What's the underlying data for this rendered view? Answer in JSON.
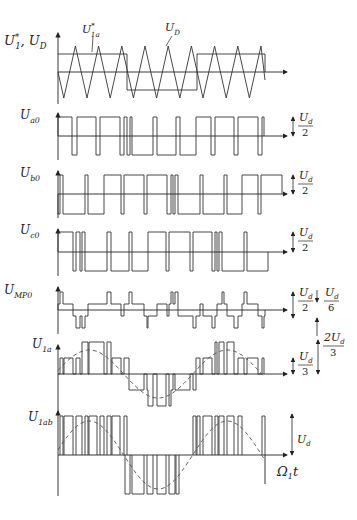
{
  "figure": {
    "axis_x_start": 58,
    "axis_x_end": 287,
    "wave_x_end": 265
  },
  "panels": [
    {
      "id": "ref",
      "label_main": "U",
      "label_sup": "*",
      "label_sub": "1",
      "label_suffix": ", U",
      "label_suffix_sub": "D",
      "zero_y": 72,
      "top_y": 33,
      "bottom_y": 104,
      "callouts": [
        {
          "text": "U",
          "sup": "*",
          "sub": "1a",
          "x": 82,
          "y": 33,
          "lx1": 93,
          "ly1": 36,
          "lx2": 92,
          "ly2": 52
        },
        {
          "text": "U",
          "sub": "D",
          "x": 165,
          "y": 31,
          "lx1": 172,
          "ly1": 36,
          "lx2": 166,
          "ly2": 46
        }
      ],
      "triangle": {
        "peak_y": 46,
        "valley_y": 98,
        "start_x": 58,
        "start_y": 72,
        "half_period": 11.6
      },
      "reference": [
        [
          58,
          54
        ],
        [
          127,
          54
        ],
        [
          127,
          90
        ],
        [
          197,
          90
        ],
        [
          197,
          54
        ],
        [
          265,
          54
        ],
        [
          265,
          72
        ]
      ]
    },
    {
      "id": "ua0",
      "label": "U",
      "label_sub": "a0",
      "zero_y": 136,
      "high_y": 117,
      "low_y": 155,
      "top_y": 113,
      "bottom_y": 160,
      "scale_text": "U",
      "scale_sub": "d",
      "scale_den": "2",
      "edges": [
        58,
        72,
        77,
        96,
        100,
        120,
        124,
        127,
        130,
        132,
        153,
        157,
        176,
        180,
        196,
        211,
        215,
        234,
        238,
        258,
        262,
        264
      ],
      "start": "high"
    },
    {
      "id": "ub0",
      "label": "U",
      "label_sub": "b0",
      "zero_y": 194,
      "high_y": 175,
      "low_y": 214,
      "top_y": 171,
      "bottom_y": 218,
      "scale_text": "U",
      "scale_sub": "d",
      "scale_den": "2",
      "edges": [
        58,
        60,
        63,
        85,
        88,
        104,
        121,
        124,
        144,
        147,
        167,
        171,
        173,
        175,
        178,
        200,
        203,
        224,
        227,
        242,
        258,
        261,
        282
      ],
      "start": "low"
    },
    {
      "id": "uc0",
      "label": "U",
      "label_sub": "c0",
      "zero_y": 252,
      "high_y": 232,
      "low_y": 271,
      "top_y": 229,
      "bottom_y": 276,
      "scale_text": "U",
      "scale_sub": "d",
      "scale_den": "2",
      "edges": [
        58,
        73,
        76,
        80,
        82,
        85,
        107,
        111,
        129,
        132,
        148,
        166,
        169,
        190,
        193,
        212,
        215,
        217,
        219,
        222,
        244,
        247,
        268
      ],
      "start": "high"
    },
    {
      "id": "ump0",
      "label": "U",
      "label_sub": "MP0",
      "zero_y": 310,
      "levels": {
        "p2": 292,
        "p1": 304,
        "n1": 316,
        "n2": 328
      },
      "top_y": 287,
      "bottom_y": 334,
      "scale_text": "U",
      "scale_sub": "d",
      "scale_den": "2",
      "scale2_den": "6",
      "steps": [
        [
          58,
          "p1"
        ],
        [
          60,
          "p2"
        ],
        [
          63,
          "p1"
        ],
        [
          73,
          "n1"
        ],
        [
          76,
          "n2"
        ],
        [
          80,
          "n1"
        ],
        [
          82,
          "n2"
        ],
        [
          85,
          "n1"
        ],
        [
          88,
          "p1"
        ],
        [
          104,
          "p1"
        ],
        [
          107,
          "p2"
        ],
        [
          111,
          "p1"
        ],
        [
          121,
          "n1"
        ],
        [
          124,
          "p1"
        ],
        [
          129,
          "p2"
        ],
        [
          132,
          "p1"
        ],
        [
          144,
          "n1"
        ],
        [
          147,
          "n2"
        ],
        [
          148,
          "n1"
        ],
        [
          153,
          "n1"
        ],
        [
          157,
          "p1"
        ],
        [
          166,
          "p1"
        ],
        [
          167,
          "n1"
        ],
        [
          169,
          "p1"
        ],
        [
          171,
          "p2"
        ],
        [
          173,
          "p1"
        ],
        [
          175,
          "p2"
        ],
        [
          178,
          "n1"
        ],
        [
          190,
          "n1"
        ],
        [
          193,
          "n2"
        ],
        [
          196,
          "n1"
        ],
        [
          200,
          "p1"
        ],
        [
          203,
          "n1"
        ],
        [
          211,
          "n1"
        ],
        [
          212,
          "n2"
        ],
        [
          215,
          "n1"
        ],
        [
          217,
          "p1"
        ],
        [
          219,
          "p1"
        ],
        [
          222,
          "p2"
        ],
        [
          224,
          "p1"
        ],
        [
          227,
          "n1"
        ],
        [
          234,
          "n2"
        ],
        [
          238,
          "n1"
        ],
        [
          242,
          "p1"
        ],
        [
          244,
          "p2"
        ],
        [
          247,
          "p1"
        ],
        [
          258,
          "n1"
        ],
        [
          262,
          "n2"
        ],
        [
          264,
          "n1"
        ],
        [
          265,
          "zero"
        ]
      ]
    },
    {
      "id": "u1a",
      "label": "U",
      "label_sub": "1a",
      "zero_y": 374,
      "levels": {
        "p2": 342,
        "p1": 358,
        "n1": 390,
        "n2": 406
      },
      "top_y": 345,
      "bottom_y": 412,
      "scale_text": "U",
      "scale_sub": "d",
      "scale_den": "3",
      "scale2_num": "2U",
      "scale2_sub": "d",
      "scale2_den": "3",
      "steps": [
        [
          58,
          "zero"
        ],
        [
          60,
          "p1"
        ],
        [
          63,
          "zero"
        ],
        [
          64,
          "p1"
        ],
        [
          73,
          "zero"
        ],
        [
          76,
          "p1"
        ],
        [
          80,
          "zero"
        ],
        [
          82,
          "p2"
        ],
        [
          85,
          "p2"
        ],
        [
          88,
          "zero"
        ],
        [
          89,
          "p2"
        ],
        [
          104,
          "zero"
        ],
        [
          107,
          "p2"
        ],
        [
          111,
          "zero"
        ],
        [
          112,
          "p1"
        ],
        [
          121,
          "zero"
        ],
        [
          124,
          "p1"
        ],
        [
          129,
          "n1"
        ],
        [
          132,
          "n1"
        ],
        [
          144,
          "zero"
        ],
        [
          147,
          "n1"
        ],
        [
          148,
          "n2"
        ],
        [
          153,
          "zero"
        ],
        [
          157,
          "n2"
        ],
        [
          166,
          "zero"
        ],
        [
          169,
          "n2"
        ],
        [
          171,
          "n1"
        ],
        [
          173,
          "zero"
        ],
        [
          175,
          "n1"
        ],
        [
          190,
          "zero"
        ],
        [
          193,
          "n1"
        ],
        [
          196,
          "p1"
        ],
        [
          200,
          "zero"
        ],
        [
          203,
          "p1"
        ],
        [
          212,
          "zero"
        ],
        [
          215,
          "p2"
        ],
        [
          217,
          "zero"
        ],
        [
          219,
          "p2"
        ],
        [
          224,
          "zero"
        ],
        [
          227,
          "p2"
        ],
        [
          234,
          "zero"
        ],
        [
          238,
          "p1"
        ],
        [
          244,
          "zero"
        ],
        [
          247,
          "p1"
        ],
        [
          258,
          "zero"
        ],
        [
          262,
          "p1"
        ],
        [
          264,
          "zero"
        ]
      ],
      "dashed_amplitude": 24,
      "dashed_period": 138
    },
    {
      "id": "u1ab",
      "label": "U",
      "label_sub": "1ab",
      "zero_y": 455,
      "high_y": 416,
      "low_y": 494,
      "top_y": 411,
      "bottom_y": 496,
      "scale_text": "U",
      "scale_sub": "d",
      "time_label": "Ω",
      "time_sub": "1",
      "time_suffix": "t",
      "pulses_pos": [
        [
          60,
          63
        ],
        [
          64,
          73
        ],
        [
          76,
          82
        ],
        [
          85,
          88
        ],
        [
          89,
          97
        ],
        [
          100,
          104
        ],
        [
          107,
          111
        ],
        [
          112,
          120
        ],
        [
          124,
          127
        ],
        [
          193,
          196
        ],
        [
          197,
          200
        ],
        [
          203,
          212
        ],
        [
          215,
          218
        ],
        [
          219,
          224
        ],
        [
          227,
          234
        ],
        [
          238,
          242
        ]
      ],
      "pulses_neg": [
        [
          125,
          130
        ],
        [
          132,
          144
        ],
        [
          147,
          153
        ],
        [
          157,
          166
        ],
        [
          169,
          175
        ],
        [
          176,
          179
        ]
      ],
      "tail_pulse": [
        262,
        265
      ],
      "dashed_amplitude": 34,
      "dashed_period": 138
    }
  ]
}
